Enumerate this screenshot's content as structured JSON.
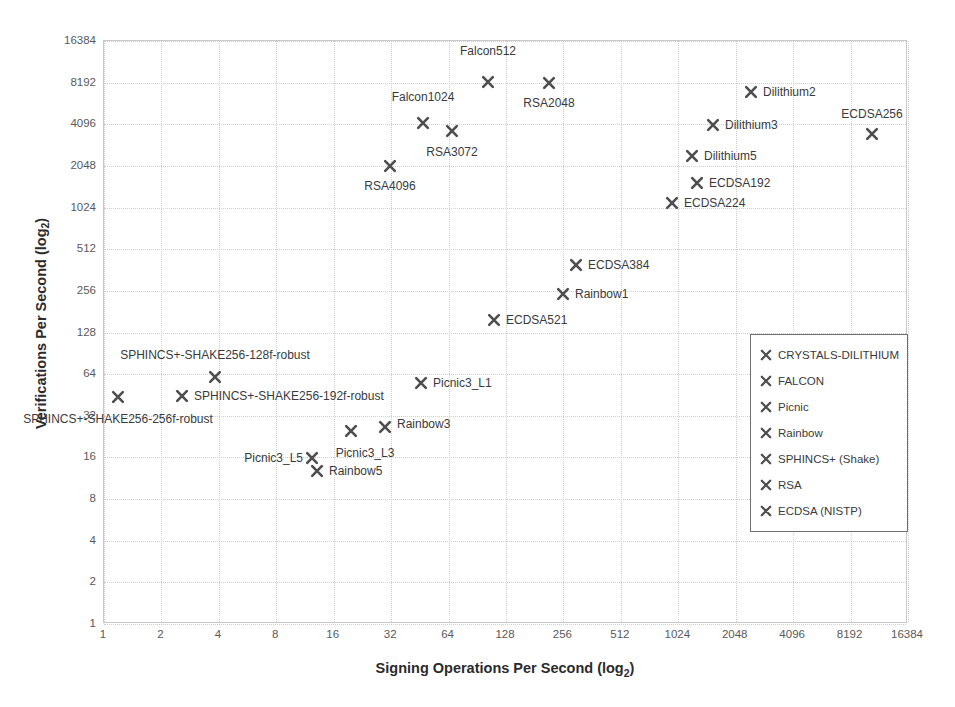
{
  "chart_data": {
    "type": "scatter",
    "title": "",
    "xlabel": "Signing Operations Per Second (log2)",
    "ylabel": "Verifications Per Second (log2)",
    "xlabel_main": "Signing Operations Per Second (log",
    "xlabel_sub": "2",
    "xlabel_tail": ")",
    "ylabel_main": "Verifications Per Second (log",
    "ylabel_sub": "2",
    "ylabel_tail": ")",
    "grid": true,
    "xscale": "log2",
    "yscale": "log2",
    "xlim": [
      1,
      16384
    ],
    "ylim": [
      1,
      16384
    ],
    "xticks": [
      "1",
      "2",
      "4",
      "8",
      "16",
      "32",
      "64",
      "128",
      "256",
      "512",
      "1024",
      "2048",
      "4096",
      "8192",
      "16384"
    ],
    "yticks": [
      "1",
      "2",
      "4",
      "8",
      "16",
      "32",
      "64",
      "128",
      "256",
      "512",
      "1024",
      "2048",
      "4096",
      "8192",
      "16384"
    ],
    "marker_color": "#4e4e50",
    "legend_position": "inside-right-middle",
    "legend": [
      {
        "label": "CRYSTALS-DILITHIUM",
        "marker": "x-marker"
      },
      {
        "label": "FALCON",
        "marker": "x-marker"
      },
      {
        "label": "Picnic",
        "marker": "x-marker"
      },
      {
        "label": "Rainbow",
        "marker": "x-marker"
      },
      {
        "label": "SPHINCS+ (Shake)",
        "marker": "x-marker"
      },
      {
        "label": "RSA",
        "marker": "x-marker"
      },
      {
        "label": "ECDSA (NISTP)",
        "marker": "x-marker"
      }
    ],
    "points": [
      {
        "label": "Falcon512",
        "series": "FALCON",
        "x": 97,
        "y": 9200,
        "px": 488,
        "py": 82,
        "lx": 488,
        "ly": 58,
        "anchor": "lab-above"
      },
      {
        "label": "Falcon1024",
        "series": "FALCON",
        "x": 40,
        "y": 4400,
        "px": 423,
        "py": 123,
        "lx": 423,
        "ly": 104,
        "anchor": "lab-above"
      },
      {
        "label": "RSA2048",
        "series": "RSA",
        "x": 225,
        "y": 8800,
        "px": 549,
        "py": 83,
        "lx": 549,
        "ly": 96,
        "anchor": "lab-below"
      },
      {
        "label": "RSA3072",
        "series": "RSA",
        "x": 57,
        "y": 3700,
        "px": 452,
        "py": 131,
        "lx": 452,
        "ly": 145,
        "anchor": "lab-below"
      },
      {
        "label": "RSA4096",
        "series": "RSA",
        "x": 31,
        "y": 2100,
        "px": 390,
        "py": 166,
        "lx": 390,
        "ly": 179,
        "anchor": "lab-below"
      },
      {
        "label": "Dilithium2",
        "series": "CRYSTALS-DILITHIUM",
        "x": 1950,
        "y": 7400,
        "px": 751,
        "py": 92,
        "lx": 763,
        "ly": 92,
        "anchor": "lab-right"
      },
      {
        "label": "Dilithium3",
        "series": "CRYSTALS-DILITHIUM",
        "x": 1350,
        "y": 4000,
        "px": 713,
        "py": 125,
        "lx": 725,
        "ly": 125,
        "anchor": "lab-right"
      },
      {
        "label": "Dilithium5",
        "series": "CRYSTALS-DILITHIUM",
        "x": 1050,
        "y": 2500,
        "px": 692,
        "py": 156,
        "lx": 704,
        "ly": 156,
        "anchor": "lab-right"
      },
      {
        "label": "ECDSA192",
        "series": "ECDSA (NISTP)",
        "x": 1100,
        "y": 1600,
        "px": 697,
        "py": 183,
        "lx": 709,
        "ly": 183,
        "anchor": "lab-right"
      },
      {
        "label": "ECDSA224",
        "series": "ECDSA (NISTP)",
        "x": 920,
        "y": 1250,
        "px": 672,
        "py": 203,
        "lx": 684,
        "ly": 203,
        "anchor": "lab-right"
      },
      {
        "label": "ECDSA256",
        "series": "ECDSA (NISTP)",
        "x": 9800,
        "y": 3900,
        "px": 872,
        "py": 134,
        "lx": 872,
        "ly": 121,
        "anchor": "lab-above"
      },
      {
        "label": "ECDSA384",
        "series": "ECDSA (NISTP)",
        "x": 250,
        "y": 420,
        "px": 576,
        "py": 265,
        "lx": 588,
        "ly": 265,
        "anchor": "lab-right"
      },
      {
        "label": "Rainbow1",
        "series": "Rainbow",
        "x": 255,
        "y": 256,
        "px": 563,
        "py": 294,
        "lx": 575,
        "ly": 294,
        "anchor": "lab-right"
      },
      {
        "label": "ECDSA521",
        "series": "ECDSA (NISTP)",
        "x": 100,
        "y": 165,
        "px": 494,
        "py": 320,
        "lx": 506,
        "ly": 320,
        "anchor": "lab-right"
      },
      {
        "label": "SPHINCS+-SHAKE256-128f-robust",
        "series": "SPHINCS+ (Shake)",
        "x": 3.9,
        "y": 62,
        "px": 215,
        "py": 377,
        "lx": 215,
        "ly": 362,
        "anchor": "lab-above"
      },
      {
        "label": "SPHINCS+-SHAKE256-192f-robust",
        "series": "SPHINCS+ (Shake)",
        "x": 2.7,
        "y": 44,
        "px": 182,
        "py": 396,
        "lx": 194,
        "ly": 396,
        "anchor": "lab-right"
      },
      {
        "label": "SPHINCS+-SHAKE256-256f-robust",
        "series": "SPHINCS+ (Shake)",
        "x": 1.4,
        "y": 44,
        "px": 118,
        "py": 397,
        "lx": 118,
        "ly": 412,
        "anchor": "lab-below"
      },
      {
        "label": "Picnic3_L1",
        "series": "Picnic",
        "x": 44,
        "y": 57,
        "px": 421,
        "py": 383,
        "lx": 433,
        "ly": 383,
        "anchor": "lab-right"
      },
      {
        "label": "Rainbow3",
        "series": "Rainbow",
        "x": 30,
        "y": 33,
        "px": 385,
        "py": 427,
        "lx": 397,
        "ly": 424,
        "anchor": "lab-right"
      },
      {
        "label": "Picnic3_L3",
        "series": "Picnic",
        "x": 22,
        "y": 33,
        "px": 351,
        "py": 431,
        "lx": 365,
        "ly": 446,
        "anchor": "lab-below"
      },
      {
        "label": "Picnic3_L5",
        "series": "Picnic",
        "x": 13,
        "y": 17,
        "px": 312,
        "py": 458,
        "lx": 303,
        "ly": 458,
        "anchor": "lab-left"
      },
      {
        "label": "Rainbow5",
        "series": "Rainbow",
        "x": 13,
        "y": 13,
        "px": 317,
        "py": 471,
        "lx": 329,
        "ly": 471,
        "anchor": "lab-right"
      }
    ]
  }
}
